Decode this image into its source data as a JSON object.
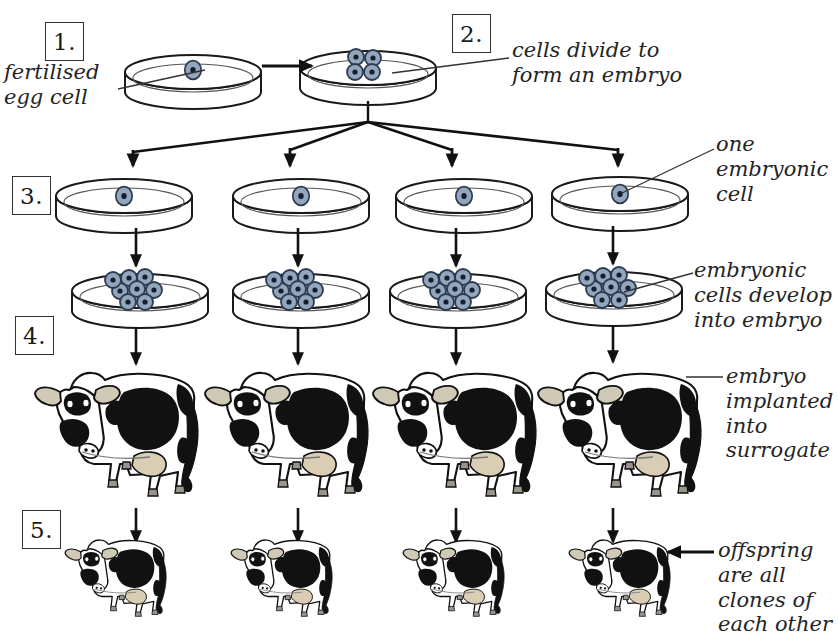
{
  "diagram": {
    "background": "#ffffff",
    "ink": "#1a1a1a",
    "cell_fill": "#93a6bd",
    "cell_nucleus": "#15202e",
    "udder_fill": "#d9cdb4",
    "ear_fill": "#cfc9b6"
  },
  "steps": [
    {
      "id": "step-1",
      "label": "1.",
      "x": 45,
      "y": 22
    },
    {
      "id": "step-2",
      "label": "2.",
      "x": 452,
      "y": 14
    },
    {
      "id": "step-3",
      "label": "3.",
      "x": 10,
      "y": 176
    },
    {
      "id": "step-4",
      "label": "4.",
      "x": 13,
      "y": 315
    },
    {
      "id": "step-5",
      "label": "5.",
      "x": 20,
      "y": 509
    }
  ],
  "annotations": [
    {
      "id": "fertilised-egg-cell",
      "text": "fertilised\negg cell",
      "x": 4,
      "y": 60,
      "align": "left"
    },
    {
      "id": "cells-divide",
      "text": "cells divide to\nform an embryo",
      "x": 512,
      "y": 38,
      "align": "left"
    },
    {
      "id": "one-embryonic-cell",
      "text": "one\nembryonic\ncell",
      "x": 718,
      "y": 134,
      "align": "left"
    },
    {
      "id": "embryonic-cells-develop",
      "text": "embryonic\ncells develop\ninto embryo",
      "x": 697,
      "y": 258,
      "align": "left"
    },
    {
      "id": "embryo-implanted",
      "text": "embryo\nimplanted\ninto\nsurrogate",
      "x": 727,
      "y": 364,
      "align": "left"
    },
    {
      "id": "offspring-clones",
      "text": "offspring\nare all\nclones of\neach other",
      "x": 718,
      "y": 538,
      "align": "left"
    }
  ],
  "dishes": {
    "row_top": [
      {
        "id": "dish-fertilised-egg",
        "cx": 193,
        "cy": 72,
        "cells": 1
      },
      {
        "id": "dish-embryo",
        "cx": 368,
        "cy": 68,
        "cells": 4
      }
    ],
    "row_single_cell": [
      {
        "id": "dish-embryonic-cell-1",
        "cx": 124,
        "cy": 196,
        "cells": 1
      },
      {
        "id": "dish-embryonic-cell-2",
        "cx": 301,
        "cy": 196,
        "cells": 1
      },
      {
        "id": "dish-embryonic-cell-3",
        "cx": 464,
        "cy": 196,
        "cells": 1
      },
      {
        "id": "dish-embryonic-cell-4",
        "cx": 620,
        "cy": 194,
        "cells": 1
      }
    ],
    "row_embryo": [
      {
        "id": "dish-developed-embryo-1",
        "cx": 140,
        "cy": 291,
        "cells": 8
      },
      {
        "id": "dish-developed-embryo-2",
        "cx": 301,
        "cy": 291,
        "cells": 8
      },
      {
        "id": "dish-developed-embryo-3",
        "cx": 458,
        "cy": 291,
        "cells": 8
      },
      {
        "id": "dish-developed-embryo-4",
        "cx": 614,
        "cy": 289,
        "cells": 8
      }
    ]
  },
  "cows": {
    "surrogates": [
      {
        "id": "surrogate-cow-1",
        "x": 30,
        "y": 360,
        "scale": 1.0
      },
      {
        "id": "surrogate-cow-2",
        "x": 208,
        "y": 360,
        "scale": 1.0
      },
      {
        "id": "surrogate-cow-3",
        "x": 378,
        "y": 360,
        "scale": 1.0
      },
      {
        "id": "surrogate-cow-4",
        "x": 543,
        "y": 360,
        "scale": 1.0
      }
    ],
    "offspring": [
      {
        "id": "offspring-calf-1",
        "x": 62,
        "y": 532,
        "scale": 0.62
      },
      {
        "id": "offspring-calf-2",
        "x": 228,
        "y": 532,
        "scale": 0.62
      },
      {
        "id": "offspring-calf-3",
        "x": 404,
        "y": 532,
        "scale": 0.62
      },
      {
        "id": "offspring-calf-4",
        "x": 572,
        "y": 532,
        "scale": 0.62
      }
    ]
  },
  "arrows": {
    "horizontal": [
      {
        "id": "arrow-divide",
        "x1": 262,
        "y1": 66,
        "x2": 312,
        "y2": 66
      }
    ],
    "branch_origin": {
      "x": 368,
      "y": 104
    },
    "branch_targets": [
      133,
      290,
      452,
      618
    ],
    "branch_y_bus": 121,
    "branch_y_tip": 166,
    "vertical": [
      {
        "id": "arrow-dish-to-embryo-1",
        "x": 136,
        "y1": 228,
        "y2": 266
      },
      {
        "id": "arrow-dish-to-embryo-2",
        "x": 298,
        "y1": 228,
        "y2": 266
      },
      {
        "id": "arrow-dish-to-embryo-3",
        "x": 456,
        "y1": 228,
        "y2": 266
      },
      {
        "id": "arrow-dish-to-embryo-4",
        "x": 613,
        "y1": 228,
        "y2": 266
      },
      {
        "id": "arrow-embryo-to-cow-1",
        "x": 136,
        "y1": 325,
        "y2": 362
      },
      {
        "id": "arrow-embryo-to-cow-2",
        "x": 298,
        "y1": 325,
        "y2": 362
      },
      {
        "id": "arrow-embryo-to-cow-3",
        "x": 456,
        "y1": 325,
        "y2": 362
      },
      {
        "id": "arrow-embryo-to-cow-4",
        "x": 613,
        "y1": 325,
        "y2": 362
      },
      {
        "id": "arrow-cow-to-calf-1",
        "x": 136,
        "y1": 505,
        "y2": 540
      },
      {
        "id": "arrow-cow-to-calf-2",
        "x": 298,
        "y1": 505,
        "y2": 540
      },
      {
        "id": "arrow-cow-to-calf-3",
        "x": 456,
        "y1": 505,
        "y2": 540
      },
      {
        "id": "arrow-cow-to-calf-4",
        "x": 613,
        "y1": 505,
        "y2": 540
      }
    ],
    "offspring_pointer": {
      "id": "arrow-offspring-label",
      "x1": 712,
      "y1": 551,
      "x2": 669,
      "y2": 551
    }
  },
  "leaders": [
    {
      "id": "leader-fertilised-egg",
      "x1": 120,
      "y1": 88,
      "x2": 200,
      "y2": 70
    },
    {
      "id": "leader-cells-divide",
      "x1": 508,
      "y1": 58,
      "x2": 392,
      "y2": 72
    },
    {
      "id": "leader-one-embryonic-cell",
      "x1": 714,
      "y1": 148,
      "x2": 621,
      "y2": 193
    },
    {
      "id": "leader-embryonic-cells-develop",
      "x1": 694,
      "y1": 272,
      "x2": 622,
      "y2": 292
    },
    {
      "id": "leader-embryo-implanted",
      "x1": 723,
      "y1": 376,
      "x2": 683,
      "y2": 376
    }
  ]
}
